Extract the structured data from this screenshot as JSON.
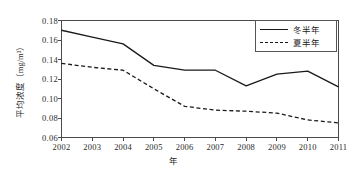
{
  "chart_data": {
    "type": "line",
    "title": "",
    "xlabel": "年",
    "ylabel": "平均浓度（mg/m³）",
    "categories": [
      "2002",
      "2003",
      "2004",
      "2005",
      "2006",
      "2007",
      "2008",
      "2009",
      "2010",
      "2011"
    ],
    "x": [
      2002,
      2003,
      2004,
      2005,
      2006,
      2007,
      2008,
      2009,
      2010,
      2011
    ],
    "xlim": [
      2002,
      2011
    ],
    "ylim": [
      0.06,
      0.18
    ],
    "yticks": [
      0.18,
      0.16,
      0.14,
      0.12,
      0.1,
      0.08,
      0.06
    ],
    "ytick_labels": [
      "0.18",
      "0.16",
      "0.14",
      "0.12",
      "0.10",
      "0.08",
      "0.06"
    ],
    "grid": false,
    "legend_position": "top-right",
    "series": [
      {
        "name": "冬半年",
        "style": "solid",
        "color": "#1a1a1a",
        "values": [
          0.17,
          0.163,
          0.156,
          0.134,
          0.129,
          0.129,
          0.113,
          0.125,
          0.128,
          0.112
        ]
      },
      {
        "name": "夏半年",
        "style": "dashed",
        "color": "#1a1a1a",
        "values": [
          0.136,
          0.132,
          0.129,
          0.11,
          0.092,
          0.088,
          0.087,
          0.085,
          0.078,
          0.075
        ]
      }
    ]
  },
  "legend": {
    "entries": [
      {
        "label": "冬半年"
      },
      {
        "label": "夏半年"
      }
    ]
  },
  "axes": {
    "y_title": "平均浓度（mg/m³）",
    "x_title": "年"
  },
  "colors": {
    "line": "#1a1a1a",
    "axis": "#4a4a4a",
    "background": "#ffffff",
    "text": "#2b2b2b"
  }
}
